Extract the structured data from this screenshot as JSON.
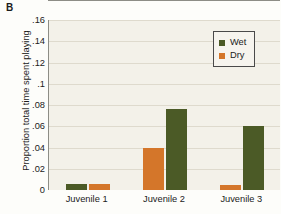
{
  "panel": {
    "letter": "B"
  },
  "chart_data": {
    "type": "bar",
    "title": "",
    "xlabel": "",
    "ylabel": "Proportion total time spent playing",
    "categories": [
      "Juvenile 1",
      "Juvenile 2",
      "Juvenile 3"
    ],
    "series": [
      {
        "name": "Wet",
        "color": "#4b5a26",
        "values": [
          0.006,
          0.076,
          0.06
        ]
      },
      {
        "name": "Dry",
        "color": "#d4762a",
        "values": [
          0.006,
          0.04,
          0.005
        ]
      }
    ],
    "bar_order": [
      [
        "Wet",
        "Dry"
      ],
      [
        "Dry",
        "Wet"
      ],
      [
        "Dry",
        "Wet"
      ]
    ],
    "ylim": [
      0,
      0.16
    ],
    "ytick_values": [
      0,
      0.02,
      0.04,
      0.06,
      0.08,
      0.1,
      0.12,
      0.14,
      0.16
    ],
    "ytick_labels": [
      "0",
      ".02",
      ".04",
      ".06",
      ".08",
      ".1",
      ".12",
      ".14",
      ".16"
    ],
    "grid": true,
    "legend_position": "top-right",
    "legend_entries": [
      {
        "label": "Wet",
        "color": "#4b5a26"
      },
      {
        "label": "Dry",
        "color": "#d4762a"
      }
    ],
    "plot_background": "#f3f1e9",
    "gridline_color": "#dedacd",
    "axis_color": "#8d8d86"
  }
}
